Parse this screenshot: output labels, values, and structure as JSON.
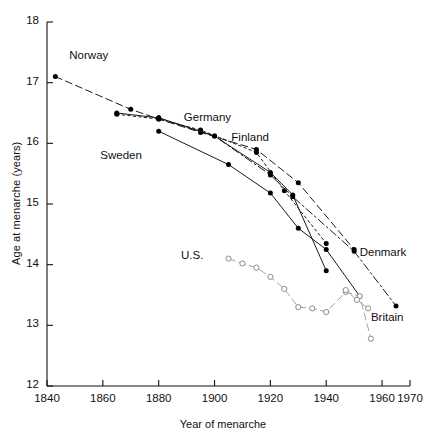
{
  "chart_data": {
    "type": "line",
    "title": "",
    "xlabel": "Year of menarche",
    "ylabel": "Age at menarche (years)",
    "xlim": [
      1840,
      1970
    ],
    "ylim": [
      12,
      18
    ],
    "xticks": [
      1840,
      1860,
      1880,
      1900,
      1920,
      1940,
      1960,
      1970
    ],
    "yticks": [
      12,
      13,
      14,
      15,
      16,
      17,
      18
    ],
    "grid": false,
    "legend_position": "inline-labels",
    "marker_styles": {
      "filled": "solid black circle",
      "open": "open circle"
    },
    "series": [
      {
        "name": "Norway",
        "marker": "filled",
        "line": "dashed",
        "label_x": 1848,
        "label_y": 17.42,
        "points": [
          {
            "x": 1843,
            "y": 17.1
          },
          {
            "x": 1870,
            "y": 16.56
          },
          {
            "x": 1880,
            "y": 16.4
          },
          {
            "x": 1895,
            "y": 16.18
          },
          {
            "x": 1915,
            "y": 15.9
          },
          {
            "x": 1930,
            "y": 15.35
          },
          {
            "x": 1950,
            "y": 14.25
          }
        ]
      },
      {
        "name": "Germany",
        "marker": "filled",
        "line": "dotted",
        "label_x": 1889,
        "label_y": 16.4,
        "points": [
          {
            "x": 1865,
            "y": 16.48
          },
          {
            "x": 1880,
            "y": 16.4
          },
          {
            "x": 1895,
            "y": 16.22
          },
          {
            "x": 1915,
            "y": 15.85
          },
          {
            "x": 1925,
            "y": 15.22
          },
          {
            "x": 1940,
            "y": 14.35
          }
        ]
      },
      {
        "name": "Finland",
        "marker": "filled",
        "line": "solid",
        "label_x": 1906,
        "label_y": 16.08,
        "points": [
          {
            "x": 1865,
            "y": 16.5
          },
          {
            "x": 1880,
            "y": 16.42
          },
          {
            "x": 1900,
            "y": 16.12
          },
          {
            "x": 1920,
            "y": 15.52
          },
          {
            "x": 1928,
            "y": 15.15
          },
          {
            "x": 1940,
            "y": 13.9
          }
        ]
      },
      {
        "name": "Sweden",
        "marker": "filled",
        "line": "solid",
        "label_x": 1874,
        "label_y": 15.78,
        "points": [
          {
            "x": 1880,
            "y": 16.2
          },
          {
            "x": 1905,
            "y": 15.65
          },
          {
            "x": 1920,
            "y": 15.18
          },
          {
            "x": 1930,
            "y": 14.6
          },
          {
            "x": 1940,
            "y": 14.25
          },
          {
            "x": 1952,
            "y": 13.48
          }
        ]
      },
      {
        "name": "Denmark",
        "marker": "filled",
        "line": "dash-dot",
        "label_x": 1952,
        "label_y": 14.18,
        "points": [
          {
            "x": 1880,
            "y": 16.42
          },
          {
            "x": 1900,
            "y": 16.12
          },
          {
            "x": 1920,
            "y": 15.48
          },
          {
            "x": 1928,
            "y": 15.12
          },
          {
            "x": 1950,
            "y": 14.22
          },
          {
            "x": 1965,
            "y": 13.32
          }
        ]
      },
      {
        "name": "U.S.",
        "marker": "open",
        "line": "dashed",
        "label_x": 1896,
        "label_y": 14.12,
        "points": [
          {
            "x": 1905,
            "y": 14.1
          },
          {
            "x": 1910,
            "y": 14.02
          },
          {
            "x": 1915,
            "y": 13.95
          },
          {
            "x": 1920,
            "y": 13.8
          },
          {
            "x": 1925,
            "y": 13.6
          },
          {
            "x": 1930,
            "y": 13.3
          },
          {
            "x": 1935,
            "y": 13.28
          },
          {
            "x": 1940,
            "y": 13.22
          },
          {
            "x": 1947,
            "y": 13.55
          },
          {
            "x": 1952,
            "y": 13.48
          },
          {
            "x": 1956,
            "y": 12.78
          }
        ]
      },
      {
        "name": "Britain",
        "marker": "open",
        "line": "solid",
        "label_x": 1956,
        "label_y": 13.1,
        "points": [
          {
            "x": 1947,
            "y": 13.58
          },
          {
            "x": 1951,
            "y": 13.42
          },
          {
            "x": 1955,
            "y": 13.28
          }
        ]
      }
    ]
  },
  "axes": {
    "y_title": "Age at menarche (years)",
    "x_title": "Year of menarche",
    "ytick_labels": [
      "12",
      "13",
      "14",
      "15",
      "16",
      "17",
      "18"
    ],
    "xtick_labels": [
      "1840",
      "1860",
      "1880",
      "1900",
      "1920",
      "1940",
      "1960",
      "1970"
    ]
  },
  "series_labels": [
    {
      "name": "Norway"
    },
    {
      "name": "Germany"
    },
    {
      "name": "Finland"
    },
    {
      "name": "Sweden"
    },
    {
      "name": "Denmark"
    },
    {
      "name": "U.S."
    },
    {
      "name": "Britain"
    }
  ],
  "colors": {
    "axis": "#111111",
    "marker_filled": "#000000",
    "marker_open_stroke": "#8a8a8a",
    "line_dark": "#1a1a1a",
    "line_light": "#9a9a9a"
  }
}
